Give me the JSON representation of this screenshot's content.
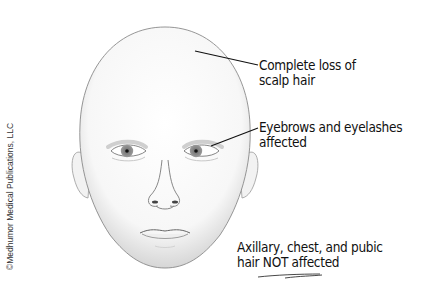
{
  "figure": {
    "credit": "©Medhumor Medical Publications, LLC",
    "annotations": [
      {
        "lines": [
          "Complete loss of",
          "scalp hair"
        ]
      },
      {
        "lines": [
          "Eyebrows and eyelashes",
          "affected"
        ]
      },
      {
        "lines": [
          "Axillary, chest, and pubic",
          "hair NOT affected"
        ]
      }
    ],
    "colors": {
      "line": "#111111",
      "skin_shadow": "#b8b8b8",
      "iris": "#8a8a8a"
    }
  }
}
